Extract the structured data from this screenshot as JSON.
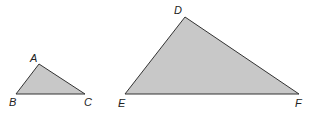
{
  "diagram": {
    "fill_color": "#c8c8c8",
    "stroke_color": "#333333",
    "triangles": [
      {
        "name": "ABC",
        "vertices": [
          {
            "label": "A",
            "x": 39,
            "y": 64,
            "lx": 30,
            "ly": 62
          },
          {
            "label": "B",
            "x": 16,
            "y": 94,
            "lx": 9,
            "ly": 106
          },
          {
            "label": "C",
            "x": 85,
            "y": 94,
            "lx": 84,
            "ly": 106
          }
        ]
      },
      {
        "name": "DEF",
        "vertices": [
          {
            "label": "D",
            "x": 185,
            "y": 17,
            "lx": 174,
            "ly": 14
          },
          {
            "label": "E",
            "x": 125,
            "y": 94,
            "lx": 118,
            "ly": 107
          },
          {
            "label": "F",
            "x": 299,
            "y": 94,
            "lx": 295,
            "ly": 107
          }
        ]
      }
    ]
  }
}
